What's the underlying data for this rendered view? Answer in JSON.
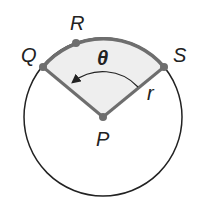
{
  "diagram": {
    "type": "circle-sector",
    "labels": {
      "Q": "Q",
      "R": "R",
      "S": "S",
      "P": "P",
      "theta": "θ",
      "radius": "r"
    },
    "colors": {
      "circle": "#222222",
      "sector_edge": "#6e6e6e",
      "sector_fill": "#eeeeee",
      "points": "#6e6e6e"
    }
  }
}
